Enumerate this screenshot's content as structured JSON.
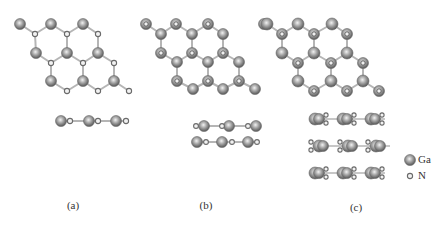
{
  "figure": {
    "colors": {
      "bond": "#b5b5b5",
      "ga_dark": "#5a5a5a",
      "ga_mid": "#9a9a9a",
      "ga_light": "#e8e8e8",
      "n_stroke": "#6a6a6a",
      "n_fill": "#f2f2f2"
    },
    "panels": [
      {
        "id": "a",
        "label": "(a)",
        "label_x": 73,
        "label_y": 206,
        "layers": 1
      },
      {
        "id": "b",
        "label": "(b)",
        "label_x": 206,
        "label_y": 206,
        "layers": 2
      },
      {
        "id": "c",
        "label": "(c)",
        "label_x": 356,
        "label_y": 208,
        "layers": 3
      }
    ],
    "legend": {
      "items": [
        {
          "symbol": "Ga",
          "label": "Ga",
          "atom": "Ga",
          "x": 410,
          "y": 160
        },
        {
          "symbol": "N",
          "label": "N",
          "atom": "N",
          "x": 410,
          "y": 176
        }
      ]
    }
  }
}
